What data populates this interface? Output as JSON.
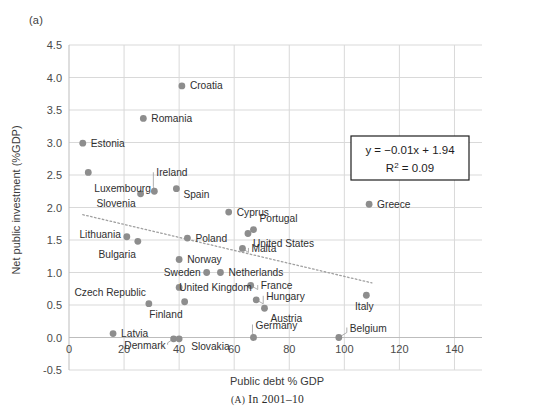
{
  "figure": {
    "panel_tag": "(a)",
    "caption_prefix": "(A)",
    "caption_text": "In 2001–10"
  },
  "equation_box": {
    "line1": "y = −0.01x + 1.94",
    "r2_prefix": "R",
    "r2_sup": "2",
    "r2_value": " = 0.09"
  },
  "chart_data": {
    "type": "scatter",
    "title": "",
    "xlabel": "Public debt % GDP",
    "ylabel": "Net public investment (%GDP)",
    "xlim": [
      0,
      150
    ],
    "ylim": [
      -0.5,
      4.5
    ],
    "xticks": [
      0,
      20,
      40,
      60,
      80,
      100,
      120,
      140
    ],
    "yticks": [
      -0.5,
      0.0,
      0.5,
      1.0,
      1.5,
      2.0,
      2.5,
      3.0,
      3.5,
      4.0,
      4.5
    ],
    "xtick_labels": [
      "0",
      "20",
      "40",
      "60",
      "80",
      "100",
      "120",
      "140"
    ],
    "ytick_labels": [
      "-0.5",
      "0.0",
      "0.5",
      "1.0",
      "1.5",
      "2.0",
      "2.5",
      "3.0",
      "3.5",
      "4.0",
      "4.5"
    ],
    "grid": true,
    "legend": "none",
    "marker_color": "#8d8d8d",
    "trendline": {
      "type": "linear",
      "equation": "y = -0.01x + 1.94",
      "r_squared": 0.09,
      "slope": -0.01,
      "intercept": 1.94,
      "x_start": 5,
      "x_end": 110,
      "style": "dotted",
      "color": "#a0a0a0"
    },
    "points": [
      {
        "label": "Croatia",
        "x": 41,
        "y": 3.87,
        "label_dx": 8,
        "label_dy": 3.5,
        "anchor": "start",
        "leader": false
      },
      {
        "label": "Romania",
        "x": 27,
        "y": 3.37,
        "label_dx": 8,
        "label_dy": 3.5,
        "anchor": "start",
        "leader": false
      },
      {
        "label": "Estonia",
        "x": 5,
        "y": 2.99,
        "label_dx": 8,
        "label_dy": 3.5,
        "anchor": "start",
        "leader": false
      },
      {
        "label": "Luxembourg",
        "x": 7,
        "y": 2.54,
        "label_dx": 6,
        "label_dy": 20,
        "anchor": "start",
        "leader": false
      },
      {
        "label": "Ireland",
        "x": 31,
        "y": 2.25,
        "label_dx": 2,
        "label_dy": -15,
        "anchor": "start",
        "leader": true
      },
      {
        "label": "Spain",
        "x": 39,
        "y": 2.29,
        "label_dx": 7,
        "label_dy": 9,
        "anchor": "start",
        "leader": false
      },
      {
        "label": "Slovenia",
        "x": 26,
        "y": 2.21,
        "label_dx": -5,
        "label_dy": 13,
        "anchor": "end",
        "leader": false
      },
      {
        "label": "Cyprus",
        "x": 58,
        "y": 1.93,
        "label_dx": 8,
        "label_dy": 3.5,
        "anchor": "start",
        "leader": false
      },
      {
        "label": "Greece",
        "x": 109,
        "y": 2.05,
        "label_dx": 8,
        "label_dy": 3.5,
        "anchor": "start",
        "leader": false
      },
      {
        "label": "Portugal",
        "x": 67,
        "y": 1.66,
        "label_dx": 6,
        "label_dy": -8,
        "anchor": "start",
        "leader": false
      },
      {
        "label": "United States",
        "x": 65,
        "y": 1.6,
        "label_dx": 5,
        "label_dy": 13,
        "anchor": "start",
        "leader": false
      },
      {
        "label": "Lithuania",
        "x": 21,
        "y": 1.55,
        "label_dx": -6,
        "label_dy": 1,
        "anchor": "end",
        "leader": false
      },
      {
        "label": "Poland",
        "x": 43,
        "y": 1.53,
        "label_dx": 8,
        "label_dy": 3.5,
        "anchor": "start",
        "leader": false
      },
      {
        "label": "Malta",
        "x": 63,
        "y": 1.37,
        "label_dx": 9,
        "label_dy": 3.5,
        "anchor": "start",
        "leader": true
      },
      {
        "label": "Bulgaria",
        "x": 25,
        "y": 1.48,
        "label_dx": -2,
        "label_dy": 17,
        "anchor": "end",
        "leader": false
      },
      {
        "label": "Norway",
        "x": 40,
        "y": 1.2,
        "label_dx": 8,
        "label_dy": 3.5,
        "anchor": "start",
        "leader": false
      },
      {
        "label": "Sweden",
        "x": 50,
        "y": 1.0,
        "label_dx": -6,
        "label_dy": 3.5,
        "anchor": "end",
        "leader": false
      },
      {
        "label": "Netherlands",
        "x": 55,
        "y": 1.0,
        "label_dx": 8,
        "label_dy": 3.5,
        "anchor": "start",
        "leader": false
      },
      {
        "label": "United Kingdom",
        "x": 40,
        "y": 0.77,
        "label_dx": 0,
        "label_dy": 3.5,
        "anchor": "start",
        "leader": false
      },
      {
        "label": "France",
        "x": 66,
        "y": 0.8,
        "label_dx": 10,
        "label_dy": 3.5,
        "anchor": "start",
        "leader": true
      },
      {
        "label": "Hungary",
        "x": 68,
        "y": 0.58,
        "label_dx": 10,
        "label_dy": 0,
        "anchor": "start",
        "leader": true
      },
      {
        "label": "Czech Republic",
        "x": 29,
        "y": 0.52,
        "label_dx": -3,
        "label_dy": -8,
        "anchor": "end",
        "leader": false
      },
      {
        "label": "Finland",
        "x": 42,
        "y": 0.55,
        "label_dx": -2,
        "label_dy": 16,
        "anchor": "end",
        "leader": false
      },
      {
        "label": "Austria",
        "x": 71,
        "y": 0.45,
        "label_dx": 6,
        "label_dy": 14,
        "anchor": "start",
        "leader": false
      },
      {
        "label": "Germany",
        "x": 67,
        "y": 0.0,
        "label_dx": 2,
        "label_dy": -9,
        "anchor": "start",
        "leader": true
      },
      {
        "label": "Latvia",
        "x": 16,
        "y": 0.06,
        "label_dx": 8,
        "label_dy": 3.5,
        "anchor": "start",
        "leader": false
      },
      {
        "label": "Denmark",
        "x": 38,
        "y": -0.02,
        "label_dx": -8,
        "label_dy": 10,
        "anchor": "end",
        "leader": true
      },
      {
        "label": "Slovakia",
        "x": 40,
        "y": -0.02,
        "label_dx": 12,
        "label_dy": 11,
        "anchor": "start",
        "leader": false
      },
      {
        "label": "Italy",
        "x": 108,
        "y": 0.65,
        "label_dx": -2,
        "label_dy": 15,
        "anchor": "middle",
        "leader": false
      },
      {
        "label": "Belgium",
        "x": 98,
        "y": 0.0,
        "label_dx": 11,
        "label_dy": -6,
        "anchor": "start",
        "leader": true
      }
    ]
  }
}
